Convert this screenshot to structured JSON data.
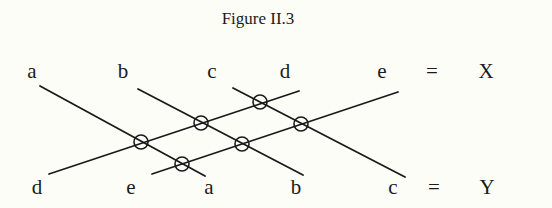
{
  "figure": {
    "title": "Figure II.3",
    "background": "#fdfdf8",
    "ink": "#1a1a1a"
  },
  "top_row": {
    "labels": [
      {
        "text": "a",
        "x": 32,
        "y": 78
      },
      {
        "text": "b",
        "x": 123,
        "y": 78
      },
      {
        "text": "c",
        "x": 212,
        "y": 78
      },
      {
        "text": "d",
        "x": 285,
        "y": 78
      },
      {
        "text": "e",
        "x": 382,
        "y": 78
      },
      {
        "text": "=",
        "x": 432,
        "y": 78
      },
      {
        "text": "X",
        "x": 486,
        "y": 78
      }
    ]
  },
  "bottom_row": {
    "labels": [
      {
        "text": "d",
        "x": 37,
        "y": 194
      },
      {
        "text": "e",
        "x": 131,
        "y": 194
      },
      {
        "text": "a",
        "x": 209,
        "y": 194
      },
      {
        "text": "b",
        "x": 296,
        "y": 194
      },
      {
        "text": "c",
        "x": 393,
        "y": 194
      },
      {
        "text": "=",
        "x": 434,
        "y": 194
      },
      {
        "text": "Y",
        "x": 487,
        "y": 194
      }
    ]
  },
  "lines": [
    {
      "name": "a",
      "x1": 40,
      "y1": 86,
      "x2": 205,
      "y2": 176
    },
    {
      "name": "b",
      "x1": 138,
      "y1": 89,
      "x2": 303,
      "y2": 175
    },
    {
      "name": "c",
      "x1": 233,
      "y1": 88,
      "x2": 405,
      "y2": 177
    },
    {
      "name": "d",
      "x1": 49,
      "y1": 174,
      "x2": 299,
      "y2": 91
    },
    {
      "name": "e",
      "x1": 152,
      "y1": 174,
      "x2": 398,
      "y2": 92
    }
  ],
  "crossings": [
    {
      "between": "a-d",
      "x": 141,
      "y": 142
    },
    {
      "between": "a-e",
      "x": 182,
      "y": 164
    },
    {
      "between": "b-d",
      "x": 201,
      "y": 123
    },
    {
      "between": "b-e",
      "x": 242,
      "y": 144
    },
    {
      "between": "c-d",
      "x": 260,
      "y": 102
    },
    {
      "between": "c-e",
      "x": 301,
      "y": 124
    }
  ],
  "crossing_radius": 7
}
